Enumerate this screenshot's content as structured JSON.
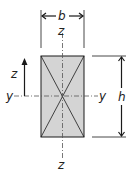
{
  "diagram": {
    "colors": {
      "fill": "#d4d4d4",
      "stroke": "#1a1a1a",
      "axis": "#555555",
      "background": "#ffffff"
    },
    "labels": {
      "width": "b",
      "height": "h",
      "axis_z_top": "z",
      "axis_z_bottom": "z",
      "axis_y_left": "y",
      "axis_y_right": "y",
      "axis_z_arrow": "z"
    },
    "section": {
      "x": 41,
      "y": 56,
      "width": 43,
      "height": 81
    },
    "icons": {
      "width_dimension": "double-arrow-horizontal-icon",
      "height_dimension": "double-arrow-vertical-icon",
      "z_direction": "arrow-up-icon"
    }
  }
}
